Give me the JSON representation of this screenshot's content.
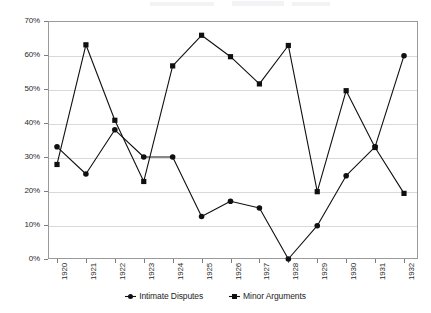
{
  "chart_data": {
    "type": "line",
    "title": "",
    "xlabel": "",
    "ylabel": "",
    "categories": [
      "1920",
      "1921",
      "1922",
      "1923",
      "1924",
      "1925",
      "1926",
      "1927",
      "1928",
      "1929",
      "1930",
      "1931",
      "1932"
    ],
    "ylim": [
      0,
      70
    ],
    "ytick_labels": [
      "0%",
      "10%",
      "20%",
      "30%",
      "40%",
      "50%",
      "60%",
      "70%"
    ],
    "ytick_values": [
      0,
      10,
      20,
      30,
      40,
      50,
      60,
      70
    ],
    "grid": true,
    "legend_position": "bottom",
    "series": [
      {
        "name": "Intimate Disputes",
        "marker": "circle",
        "color": "#101010",
        "values": [
          33,
          25,
          38,
          30,
          30,
          12.5,
          17,
          15,
          0,
          9.8,
          24.5,
          33,
          59.8
        ]
      },
      {
        "name": "Minor Arguments",
        "marker": "square",
        "color": "#101010",
        "values": [
          27.8,
          63,
          40.8,
          22.8,
          56.8,
          65.8,
          59.5,
          51.5,
          62.8,
          19.8,
          49.5,
          32.8,
          19.3
        ]
      }
    ]
  },
  "legend": {
    "items": [
      {
        "label": "Intimate Disputes",
        "marker": "circle"
      },
      {
        "label": "Minor Arguments",
        "marker": "square"
      }
    ]
  }
}
